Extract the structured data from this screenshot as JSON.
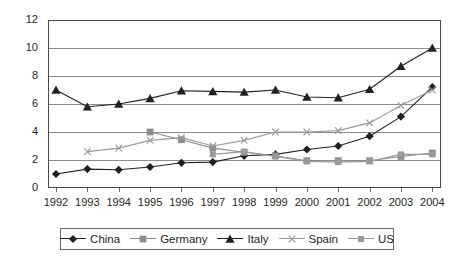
{
  "chart_data": {
    "type": "line",
    "title": "",
    "xlabel": "",
    "ylabel": "",
    "categories": [
      "1992",
      "1993",
      "1994",
      "1995",
      "1996",
      "1997",
      "1998",
      "1999",
      "2000",
      "2001",
      "2002",
      "2003",
      "2004"
    ],
    "x_tick_labels": [
      "1992",
      "1993",
      "1994",
      "1995",
      "1996",
      "1997",
      "1998",
      "1999",
      "2000",
      "2001",
      "2002",
      "2003",
      "2004"
    ],
    "y_tick_labels": [
      "0",
      "2",
      "4",
      "6",
      "8",
      "10",
      "12"
    ],
    "y_ticks": [
      0,
      2,
      4,
      6,
      8,
      10,
      12
    ],
    "ylim": [
      0,
      12
    ],
    "grid": "horizontal",
    "legend_position": "bottom",
    "series": [
      {
        "name": "China",
        "marker": "diamond",
        "color": "#231f20",
        "values": [
          1.0,
          1.35,
          1.3,
          1.5,
          1.8,
          1.85,
          2.3,
          2.4,
          2.75,
          3.0,
          3.7,
          5.1,
          7.2
        ]
      },
      {
        "name": "Germany",
        "marker": "square",
        "color": "#8c8c8c",
        "values": [
          null,
          null,
          null,
          4.0,
          3.45,
          2.85,
          2.55,
          2.3,
          1.95,
          1.95,
          1.95,
          2.25,
          2.5
        ]
      },
      {
        "name": "Italy",
        "marker": "triangle",
        "color": "#231f20",
        "values": [
          7.0,
          5.8,
          6.0,
          6.4,
          6.95,
          6.9,
          6.85,
          7.0,
          6.5,
          6.45,
          7.05,
          8.7,
          10.0
        ]
      },
      {
        "name": "Spain",
        "marker": "cross",
        "color": "#9a9a9a",
        "values": [
          null,
          2.6,
          2.85,
          3.4,
          3.6,
          3.0,
          3.4,
          4.0,
          4.0,
          4.1,
          4.65,
          5.9,
          7.0
        ]
      },
      {
        "name": "US",
        "marker": "small-square",
        "color": "#9a9a9a",
        "values": [
          null,
          null,
          null,
          null,
          null,
          2.4,
          2.6,
          2.25,
          1.9,
          1.85,
          1.9,
          2.4,
          2.4
        ]
      }
    ]
  },
  "legend": {
    "entries": [
      {
        "label": "China"
      },
      {
        "label": "Germany"
      },
      {
        "label": "Italy"
      },
      {
        "label": "Spain"
      },
      {
        "label": "US"
      }
    ]
  },
  "colors": {
    "axis": "#4a4a4a",
    "grid": "#8c8c8c",
    "text": "#231f20",
    "dark_series": "#231f20",
    "light_series": "#9a9a9a",
    "background": "#ffffff"
  }
}
